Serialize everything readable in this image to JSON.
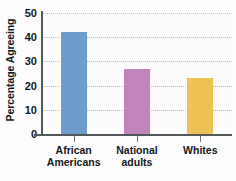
{
  "chart_data": {
    "type": "bar",
    "title": "",
    "xlabel": "",
    "ylabel": "Percentage Agreeing",
    "categories": [
      "African\nAmericans",
      "National\nadults",
      "Whites"
    ],
    "values": [
      42,
      27,
      23
    ],
    "colors": [
      "#6f9dcb",
      "#c184bd",
      "#edc254"
    ],
    "ylim": [
      0,
      50
    ],
    "yticks": [
      0,
      10,
      20,
      30,
      40,
      50
    ],
    "ytick_labels": [
      "0",
      "10",
      "20",
      "30",
      "40",
      "50"
    ],
    "grid": "horizontal-dotted",
    "legend": "none",
    "axis_color": "#53585c",
    "grid_color": "#b9bfc4",
    "background": "#fcfcfd"
  }
}
